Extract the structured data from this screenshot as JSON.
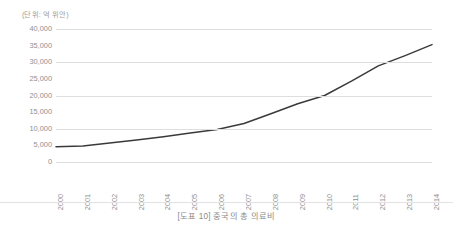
{
  "unit_note": "(단위: 억 위안)",
  "caption": "[도표 10] 중국의 총 의료비",
  "colors": {
    "line": "#3a3a3a",
    "gridline": "#dedede",
    "text": "#8f8f8f",
    "background": "#ffffff"
  },
  "chart_data": {
    "type": "line",
    "title": "[도표 10] 중국의 총 의료비",
    "subtitle": "",
    "xlabel": "",
    "ylabel": "",
    "unit": "억 위안",
    "categories": [
      "2000",
      "2001",
      "2002",
      "2003",
      "2004",
      "2005",
      "2006",
      "2007",
      "2008",
      "2009",
      "2010",
      "2011",
      "2012",
      "2013",
      "2014"
    ],
    "values": [
      4600,
      4800,
      5700,
      6600,
      7600,
      8700,
      9800,
      11600,
      14500,
      17500,
      20000,
      24300,
      28900,
      32000,
      35300
    ],
    "series": [
      {
        "name": "중국의 총 의료비",
        "values": [
          4600,
          4800,
          5700,
          6600,
          7600,
          8700,
          9800,
          11600,
          14500,
          17500,
          20000,
          24300,
          28900,
          32000,
          35300
        ]
      }
    ],
    "ylim": [
      0,
      40000
    ],
    "ytick_values": [
      40000,
      35000,
      30000,
      25000,
      20000,
      15000,
      10000,
      5000,
      0
    ],
    "ytick_labels": [
      "40,000",
      "35,000",
      "30,000",
      "25,000",
      "20,000",
      "15,000",
      "10,000",
      "5,000",
      "0"
    ],
    "gridline_values": [
      40000,
      30000,
      20000,
      10000,
      0
    ],
    "grid": true,
    "legend": false,
    "legend_position": "none",
    "xtick_rotation": 90,
    "markers": false
  }
}
